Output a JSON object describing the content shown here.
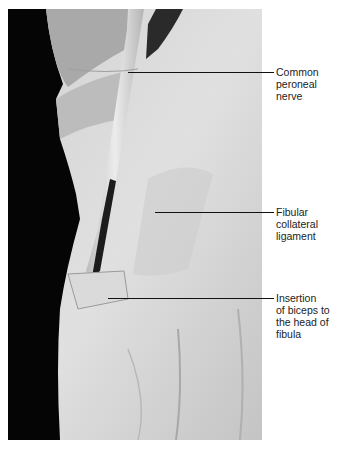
{
  "figure": {
    "labels": [
      {
        "text": "Common\nperoneal\nnerve",
        "line_y": 72,
        "line_x_start": 128,
        "label_y": 66
      },
      {
        "text": "Fibular\ncollateral\nligament",
        "line_y": 212,
        "line_x_start": 155,
        "label_y": 206
      },
      {
        "text": "Insertion\nof biceps to\nthe head of\nfibula",
        "line_y": 298,
        "line_x_start": 108,
        "label_y": 292
      }
    ],
    "colors": {
      "background": "#ffffff",
      "leader": "#111111",
      "text": "#222222",
      "backdrop": "#000000",
      "tissue": "#d6d6d6"
    }
  }
}
